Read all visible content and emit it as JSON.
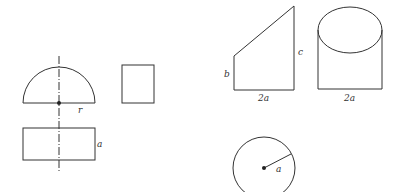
{
  "figures": {
    "hemisphere_front": {
      "label_radius": "r"
    },
    "hemisphere_base_rect": {
      "label_side": "a"
    },
    "trapezoid_view": {
      "label_left": "b",
      "label_right": "c",
      "label_bottom": "2a"
    },
    "cylinder_view": {
      "label_bottom": "2a"
    },
    "circle_view": {
      "label_radius": "a"
    }
  },
  "colors": {
    "stroke": "#333333",
    "background": "#ffffff"
  }
}
